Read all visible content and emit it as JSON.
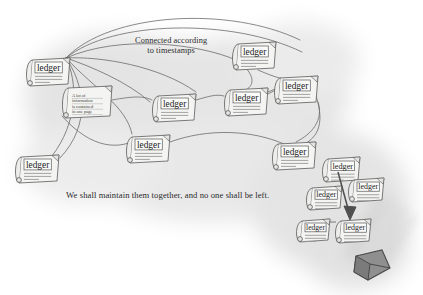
{
  "scene": {
    "title": "Distributed ledger network sketch",
    "background_color": "#ffffff",
    "cloud_color": "#e3e3e3",
    "ink_color": "#5a5a5a",
    "text_color": "#2b2b2b",
    "block_color": "#8d8d8d"
  },
  "captions": {
    "connected": "Connected according\nto timestamps",
    "maintain": "We shall maintain them together, and no one shall be left."
  },
  "node_label": "ledger",
  "note_lines": [
    "A lot of",
    "information",
    "is contained",
    "in one page"
  ],
  "nodes": [
    {
      "id": "n1",
      "label": "ledger",
      "x": 26,
      "y": 58,
      "w": 44,
      "h": 26,
      "type": "ledger"
    },
    {
      "id": "n2",
      "label": "",
      "x": 62,
      "y": 86,
      "w": 50,
      "h": 30,
      "type": "note"
    },
    {
      "id": "n3",
      "label": "ledger",
      "x": 152,
      "y": 94,
      "w": 44,
      "h": 26,
      "type": "ledger"
    },
    {
      "id": "n4",
      "label": "ledger",
      "x": 224,
      "y": 88,
      "w": 44,
      "h": 26,
      "type": "ledger"
    },
    {
      "id": "n5",
      "label": "ledger",
      "x": 232,
      "y": 42,
      "w": 44,
      "h": 26,
      "type": "ledger"
    },
    {
      "id": "n6",
      "label": "ledger",
      "x": 274,
      "y": 76,
      "w": 44,
      "h": 26,
      "type": "ledger"
    },
    {
      "id": "n7",
      "label": "ledger",
      "x": 15,
      "y": 155,
      "w": 44,
      "h": 26,
      "type": "ledger"
    },
    {
      "id": "n8",
      "label": "ledger",
      "x": 126,
      "y": 135,
      "w": 44,
      "h": 26,
      "type": "ledger"
    },
    {
      "id": "n9",
      "label": "ledger",
      "x": 272,
      "y": 142,
      "w": 44,
      "h": 26,
      "type": "ledger"
    },
    {
      "id": "n10",
      "label": "ledger",
      "x": 322,
      "y": 157,
      "w": 38,
      "h": 23,
      "type": "ledger"
    },
    {
      "id": "n11",
      "label": "ledger",
      "x": 348,
      "y": 178,
      "w": 36,
      "h": 22,
      "type": "ledger"
    },
    {
      "id": "n12",
      "label": "ledger",
      "x": 306,
      "y": 186,
      "w": 36,
      "h": 22,
      "type": "ledger"
    },
    {
      "id": "n13",
      "label": "ledger",
      "x": 296,
      "y": 219,
      "w": 34,
      "h": 21,
      "type": "ledger"
    },
    {
      "id": "n14",
      "label": "ledger",
      "x": 335,
      "y": 219,
      "w": 36,
      "h": 22,
      "type": "ledger"
    }
  ],
  "block": {
    "name": "new-block",
    "x": 352,
    "y": 252,
    "w": 34,
    "h": 28
  }
}
